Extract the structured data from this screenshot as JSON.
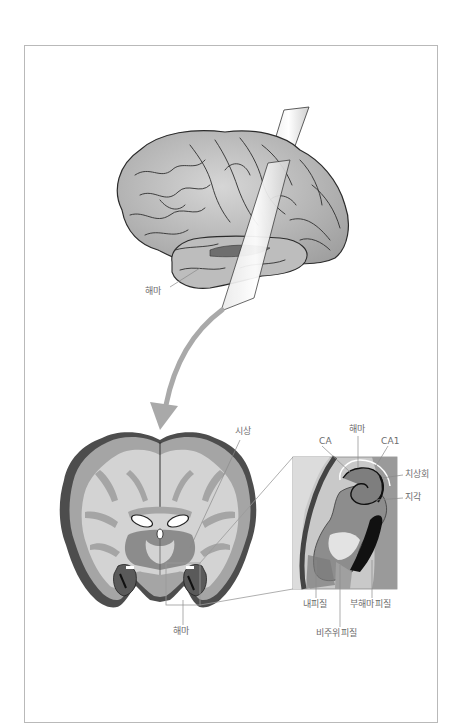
{
  "figure": {
    "colors": {
      "frame_border": "#b9b9b9",
      "label_text": "#6d6d6d",
      "leader_line": "#8a8a8a",
      "brain_surface": "#c4c4c4",
      "brain_outline": "#2b2b2b",
      "arrow": "#a9a9a9",
      "white_matter": "#d3d3d3",
      "gray_matter": "#a5a5a5",
      "dark_cortex": "#4d4d4d",
      "deep_nuclei": "#8c8c8c",
      "black_region": "#111111"
    }
  },
  "lateral_view": {
    "labels": {
      "hippocampus": "해마"
    }
  },
  "coronal_section": {
    "labels": {
      "thalamus": "시상",
      "hippocampus": "해마"
    }
  },
  "inset": {
    "labels": {
      "hippocampus": "해마",
      "ca": "CA",
      "ca1": "CA1",
      "dentate_gyrus": "치상회",
      "subiculum": "지각",
      "entorhinal_cortex": "내피질",
      "parahippocampal_cortex": "부해마피질",
      "perirhinal_cortex": "비주위피질"
    }
  }
}
